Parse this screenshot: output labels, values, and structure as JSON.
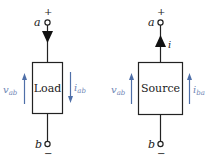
{
  "colors": {
    "line": "#222222",
    "accent": "#4f6fa8",
    "label": "#6f86b5"
  },
  "left_circuit": {
    "box_label": "Load",
    "top_terminal": "a",
    "top_polarity": "+",
    "bottom_terminal": "b",
    "bottom_polarity": "−",
    "voltage_label": "v",
    "voltage_sub": "ab",
    "current_label": "i",
    "current_sub": "ab",
    "current_direction": "down",
    "wire_arrow_direction": "down"
  },
  "right_circuit": {
    "box_label": "Source",
    "top_terminal": "a",
    "top_polarity": "+",
    "bottom_terminal": "b",
    "bottom_polarity": "−",
    "wire_current_label": "i",
    "voltage_label": "v",
    "voltage_sub": "ab",
    "current_label": "i",
    "current_sub": "ba",
    "current_direction": "up",
    "wire_arrow_direction": "up"
  }
}
